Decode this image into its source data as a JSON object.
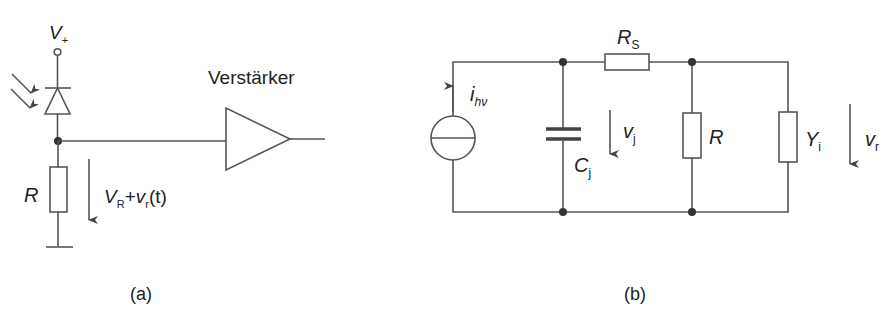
{
  "figure_a": {
    "caption": "(a)",
    "supply_label": "V",
    "supply_sub": "+",
    "resistor_label": "R",
    "voltage_label_main": "V",
    "voltage_label_sub1": "R",
    "voltage_label_plus": "+",
    "voltage_label_v": "v",
    "voltage_label_sub2": "r",
    "voltage_label_arg": "(t)",
    "amplifier_label": "Verstärker"
  },
  "figure_b": {
    "caption": "(b)",
    "source_label": "i",
    "source_sub": "hν",
    "capacitor_label": "C",
    "capacitor_sub": "j",
    "junction_voltage": "v",
    "junction_voltage_sub": "j",
    "series_resistor": "R",
    "series_resistor_sub": "S",
    "load_resistor": "R",
    "input_admittance": "Y",
    "input_admittance_sub": "i",
    "output_voltage": "v",
    "output_voltage_sub": "r"
  },
  "colors": {
    "line": "#555555",
    "node": "#333333",
    "text": "#222222"
  }
}
